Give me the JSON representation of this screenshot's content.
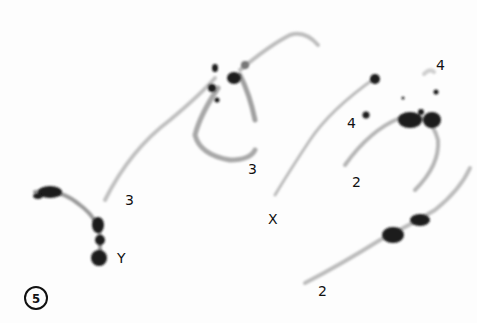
{
  "figure": {
    "panel_number": "5",
    "labels": [
      {
        "id": "label-y",
        "text": "Y"
      },
      {
        "id": "label-3-left",
        "text": "3"
      },
      {
        "id": "label-3-right",
        "text": "3"
      },
      {
        "id": "label-x",
        "text": "X"
      },
      {
        "id": "label-4-left",
        "text": "4"
      },
      {
        "id": "label-4-top",
        "text": "4"
      },
      {
        "id": "label-2-upper",
        "text": "2"
      },
      {
        "id": "label-2-lower",
        "text": "2"
      }
    ],
    "colors": {
      "background": "#fdfdfd",
      "chromatin_light": "#b8b8b8",
      "chromatin_dark": "#1a1a1a"
    }
  }
}
